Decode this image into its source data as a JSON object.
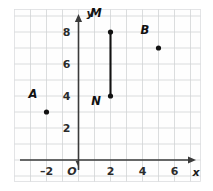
{
  "chart_data": {
    "type": "scatter",
    "title": "",
    "xlabel": "x",
    "ylabel": "y",
    "origin_label": "O",
    "xlim": [
      -3,
      7.6
    ],
    "ylim": [
      -1.4,
      10.4
    ],
    "grid": true,
    "grid_step": 1,
    "legend": "none",
    "xticks": [
      -2,
      2,
      4,
      6
    ],
    "xtick_labels": [
      "–2",
      "2",
      "4",
      "6"
    ],
    "yticks": [
      2,
      4,
      6,
      8
    ],
    "ytick_labels": [
      "2",
      "4",
      "6",
      "8"
    ],
    "points": [
      {
        "label": "A",
        "x": -2,
        "y": 3,
        "label_dx": -0.85,
        "label_dy": 0.85
      },
      {
        "label": "B",
        "x": 5,
        "y": 7,
        "label_dx": -0.85,
        "label_dy": 0.85
      },
      {
        "label": "M",
        "x": 2,
        "y": 8,
        "label_dx": -0.9,
        "label_dy": 0.95
      },
      {
        "label": "N",
        "x": 2,
        "y": 4,
        "label_dx": -0.9,
        "label_dy": -0.55
      }
    ],
    "segments": [
      {
        "name": "MN",
        "from": "M",
        "to": "N",
        "x1": 2,
        "y1": 8,
        "x2": 2,
        "y2": 4
      }
    ],
    "colors": {
      "point": "#121212",
      "segment": "#121212",
      "axis": "#3a3a3a",
      "grid": "#d2d4d6",
      "background": "#ffffff"
    }
  }
}
